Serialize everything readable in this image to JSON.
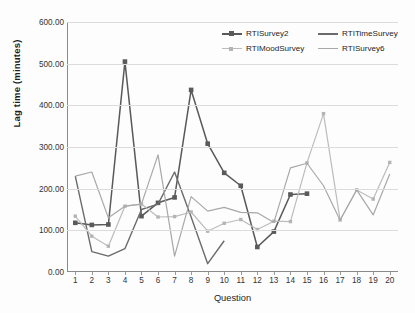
{
  "chart_data": {
    "type": "line",
    "title": "",
    "xlabel": "Question",
    "ylabel": "Lag time (minutes)",
    "xlim": [
      1,
      20
    ],
    "ylim": [
      0,
      600
    ],
    "ytick_labels": [
      "0.00",
      "100.00",
      "200.00",
      "300.00",
      "400.00",
      "500.00",
      "600.00"
    ],
    "ytick_values": [
      0,
      100,
      200,
      300,
      400,
      500,
      600
    ],
    "xtick_labels": [
      "1",
      "2",
      "3",
      "4",
      "5",
      "6",
      "7",
      "8",
      "9",
      "10",
      "11",
      "12",
      "13",
      "14",
      "15",
      "16",
      "17",
      "18",
      "19",
      "20"
    ],
    "x": [
      1,
      2,
      3,
      4,
      5,
      6,
      7,
      8,
      9,
      10,
      11,
      12,
      13,
      14,
      15,
      16,
      17,
      18,
      19,
      20
    ],
    "grid": "horizontal",
    "legend_position": "top-right",
    "series": [
      {
        "name": "RTISurvey2",
        "color": "#595959",
        "marker": "square",
        "marker_color": "#5a5a5a",
        "width": 1.5,
        "values": [
          118,
          113,
          114,
          505,
          134,
          166,
          179,
          437,
          308,
          238,
          207,
          60,
          97,
          186,
          188,
          null,
          null,
          null,
          null,
          null
        ]
      },
      {
        "name": "RTITimeSurvey",
        "color": "#6b6b6b",
        "marker": "none",
        "marker_color": "#6b6b6b",
        "width": 1.4,
        "values": [
          230,
          49,
          38,
          56,
          150,
          163,
          240,
          132,
          20,
          75,
          null,
          null,
          null,
          null,
          null,
          null,
          null,
          null,
          null,
          null
        ]
      },
      {
        "name": "RTIMoodSurvey",
        "color": "#bcbcbc",
        "marker": "square",
        "marker_color": "#b4b4b4",
        "width": 1.2,
        "values": [
          134,
          86,
          62,
          158,
          163,
          132,
          133,
          144,
          98,
          117,
          126,
          102,
          122,
          121,
          262,
          380,
          125,
          197,
          175,
          263
        ]
      },
      {
        "name": "RTISurvey6",
        "color": "#a8a8a8",
        "marker": "none",
        "marker_color": "#a8a8a8",
        "width": 1.2,
        "values": [
          230,
          240,
          130,
          158,
          163,
          281,
          38,
          181,
          146,
          155,
          143,
          142,
          119,
          250,
          261,
          207,
          124,
          197,
          137,
          235
        ]
      }
    ]
  },
  "legend": {
    "rows": [
      [
        {
          "label": "RTISurvey2",
          "series_index": 0
        },
        {
          "label": "RTITimeSurvey",
          "series_index": 1
        }
      ],
      [
        {
          "label": "RTIMoodSurvey",
          "series_index": 2
        },
        {
          "label": "RTISurvey6",
          "series_index": 3
        }
      ]
    ]
  }
}
